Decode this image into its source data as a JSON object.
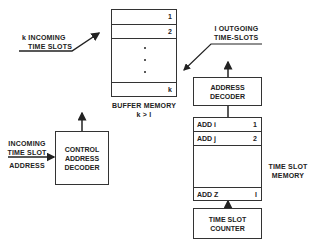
{
  "incoming_slots": {
    "line1": "k  INCOMING",
    "line2": "TIME SLOTS"
  },
  "outgoing_slots": {
    "line1": "l  OUTGOING",
    "line2": "TIME-SLOTS"
  },
  "buffer_memory": {
    "rows": [
      {
        "index": "1"
      },
      {
        "index": "2"
      },
      {
        "index": "k"
      }
    ],
    "label": "BUFFER MEMORY",
    "condition": "k > l"
  },
  "incoming_address": {
    "line1": "INCOMING",
    "line2": "TIME SLOT",
    "line3": "ADDRESS"
  },
  "control_decoder": {
    "line1": "CONTROL",
    "line2": "ADDRESS",
    "line3": "DECODER"
  },
  "address_decoder": {
    "line1": "ADDRESS",
    "line2": "DECODER"
  },
  "time_slot_memory": {
    "rows": [
      {
        "addr": "ADD i",
        "index": "1"
      },
      {
        "addr": "ADD j",
        "index": "2"
      },
      {
        "addr": "ADD Z",
        "index": "l"
      }
    ],
    "label_line1": "TIME SLOT",
    "label_line2": "MEMORY"
  },
  "time_slot_counter": {
    "line1": "TIME SLOT",
    "line2": "COUNTER"
  }
}
